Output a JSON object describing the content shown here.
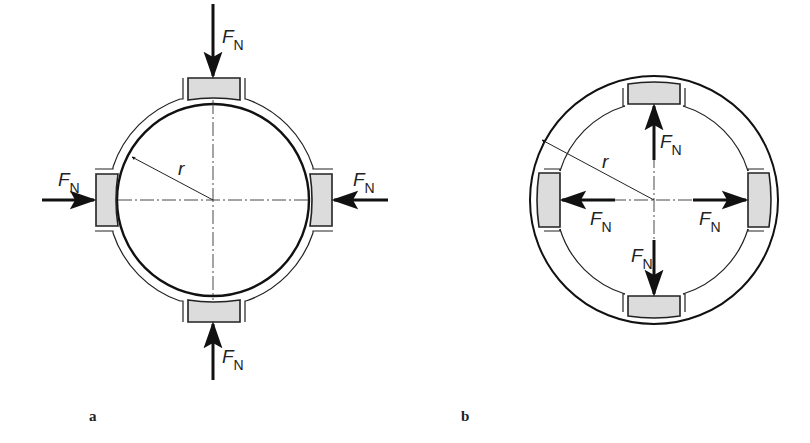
{
  "figure": {
    "panel_a": {
      "caption": "a",
      "radius_label": "r",
      "force_labels": [
        {
          "position": "top",
          "main": "F",
          "sub": "N",
          "direction": "inward"
        },
        {
          "position": "left",
          "main": "F",
          "sub": "N",
          "direction": "inward"
        },
        {
          "position": "right",
          "main": "F",
          "sub": "N",
          "direction": "inward"
        },
        {
          "position": "bottom",
          "main": "F",
          "sub": "N",
          "direction": "inward"
        }
      ]
    },
    "panel_b": {
      "caption": "b",
      "radius_label": "r",
      "force_labels": [
        {
          "position": "top",
          "main": "F",
          "sub": "N",
          "direction": "outward"
        },
        {
          "position": "left",
          "main": "F",
          "sub": "N",
          "direction": "outward"
        },
        {
          "position": "right",
          "main": "F",
          "sub": "N",
          "direction": "outward"
        },
        {
          "position": "bottom",
          "main": "F",
          "sub": "N",
          "direction": "outward"
        }
      ]
    },
    "colors": {
      "pad_fill": "#dcdcdc",
      "line": "#222222",
      "background": "#ffffff"
    }
  }
}
